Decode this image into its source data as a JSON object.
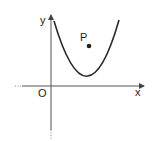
{
  "diagram": {
    "type": "coordinate-plane",
    "axes": {
      "x_label": "x",
      "y_label": "y",
      "origin_label": "O"
    },
    "curve": {
      "kind": "parabola",
      "opens": "up",
      "vertex_quadrant": "first"
    },
    "point": {
      "label": "P",
      "position": "inside parabola, above vertex"
    },
    "colors": {
      "stroke": "#2a2a2a",
      "axis": "#555555",
      "background": "#ffffff"
    }
  }
}
